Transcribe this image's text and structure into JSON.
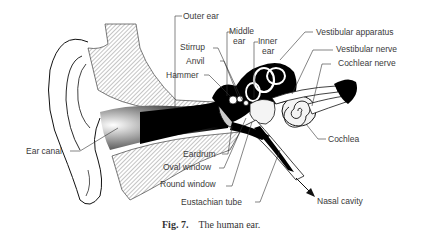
{
  "figure": {
    "caption_number": "Fig. 7.",
    "caption_text": "The human ear.",
    "title": "The human ear"
  },
  "labels": {
    "outer_ear": "Outer ear",
    "middle_ear_1": "Middle",
    "middle_ear_2": "ear",
    "inner_ear_1": "Inner",
    "inner_ear_2": "ear",
    "vestibular_apparatus": "Vestibular apparatus",
    "vestibular_nerve": "Vestibular nerve",
    "cochlear_nerve": "Cochlear nerve",
    "stirrup": "Stirrup",
    "anvil": "Anvil",
    "hammer": "Hammer",
    "ear_canal": "Ear canal",
    "eardrum": "Eardrum",
    "oval_window": "Oval window",
    "round_window": "Round window",
    "eustachian_tube": "Eustachian tube",
    "cochlea": "Cochlea",
    "nasal_cavity": "Nasal cavity"
  },
  "colors": {
    "ink": "#111111",
    "label_text": "#3a3a3a",
    "background": "#ffffff"
  }
}
